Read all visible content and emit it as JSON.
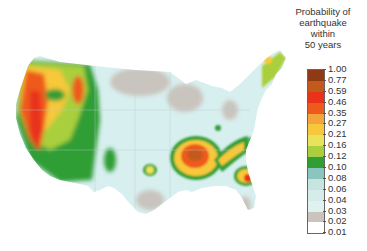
{
  "legend": {
    "title_lines": [
      "Probability of",
      "earthquake",
      "within",
      "50 years"
    ],
    "labels": [
      "1.00",
      "0.77",
      "0.59",
      "0.46",
      "0.35",
      "0.27",
      "0.21",
      "0.16",
      "0.12",
      "0.10",
      "0.08",
      "0.06",
      "0.04",
      "0.03",
      "0.02",
      "0.01"
    ],
    "colors": [
      "#8f3a14",
      "#c25a1c",
      "#e8321a",
      "#ee5a1c",
      "#f3a43a",
      "#f8c83a",
      "#e8e35a",
      "#a9cf3e",
      "#2f9e34",
      "#8cc5c0",
      "#c6e4e0",
      "#d5ecea",
      "#e0f2f0",
      "#c9c4bd",
      "#ffffff"
    ]
  },
  "map": {
    "title": "United States earthquake probability map",
    "base_color": "#d8efef",
    "low_color": "#c9c4bd",
    "high_zones": [
      "Pacific coast",
      "New Madrid seismic zone",
      "Charleston, South Carolina"
    ]
  }
}
